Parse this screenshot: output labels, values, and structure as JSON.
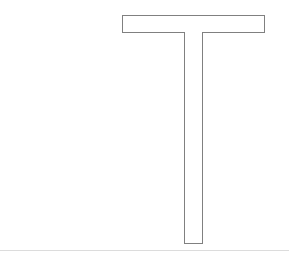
{
  "canvas": {
    "width": 289,
    "height": 258,
    "background_color": "#ffffff"
  },
  "figure": {
    "name": "t-shape-outline",
    "stroke_color": "#808080",
    "fill_color": "#ffffff",
    "stroke_width": 1,
    "parts": [
      {
        "name": "horizontal-bar",
        "x": 122,
        "y": 15,
        "width": 143,
        "height": 18
      },
      {
        "name": "vertical-stem",
        "x": 184,
        "y": 33,
        "width": 19,
        "height": 211
      }
    ]
  },
  "baseline": {
    "name": "bottom-rule",
    "color": "#dcdcdc",
    "y": 250,
    "width": 289,
    "height": 1
  }
}
